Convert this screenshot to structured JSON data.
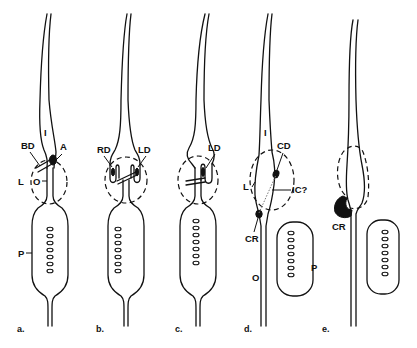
{
  "figure": {
    "panels": [
      {
        "id": "a",
        "label": "a.",
        "annotations": [
          "I",
          "BD",
          "A",
          "L",
          "O",
          "P"
        ]
      },
      {
        "id": "b",
        "label": "b.",
        "annotations": [
          "RD",
          "LD"
        ]
      },
      {
        "id": "c",
        "label": "c.",
        "annotations": [
          "LD"
        ]
      },
      {
        "id": "d",
        "label": "d.",
        "annotations": [
          "I",
          "CD",
          "L",
          "IC?",
          "CR",
          "O",
          "P"
        ]
      },
      {
        "id": "e",
        "label": "e.",
        "annotations": [
          "CR"
        ]
      }
    ],
    "labels": {
      "a": {
        "I": "I",
        "BD": "BD",
        "A": "A",
        "L": "L",
        "O": "O",
        "P": "P",
        "panel": "a."
      },
      "b": {
        "RD": "RD",
        "LD": "LD",
        "panel": "b."
      },
      "c": {
        "LD": "LD",
        "panel": "c."
      },
      "d": {
        "I": "I",
        "CD": "CD",
        "L": "L",
        "IC": "IC?",
        "CR": "CR",
        "O": "O",
        "P": "P",
        "panel": "d."
      },
      "e": {
        "CR": "CR",
        "panel": "e."
      }
    },
    "egg_count_per_body": 7,
    "colors": {
      "ink": "#111111",
      "background": "#ffffff",
      "dotted_line": "#777777"
    }
  }
}
